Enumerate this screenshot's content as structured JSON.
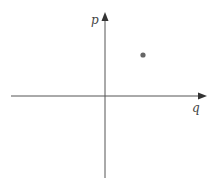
{
  "diagram": {
    "type": "coordinate-plane",
    "axes": {
      "horizontal": {
        "label": "q",
        "direction": "right"
      },
      "vertical": {
        "label": "p",
        "direction": "up"
      }
    },
    "points": [
      {
        "quadrant": "I",
        "x_px": 143,
        "y_px": 55
      }
    ],
    "colors": {
      "axis": "#555555",
      "point": "#666666",
      "label": "#444444",
      "background": "#ffffff"
    }
  }
}
